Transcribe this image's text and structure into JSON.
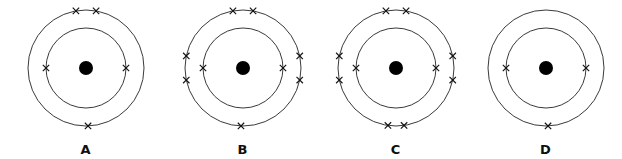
{
  "figure": {
    "background_color": "#ffffff",
    "ring_color": "#3a3a3a",
    "nucleus_color": "#000000",
    "electron_color": "#111111",
    "electron_glyph": "x",
    "width": 622,
    "height": 159
  },
  "chart_data": {
    "type": "diagram",
    "xlabel": "",
    "ylabel": "",
    "legend_position": "none",
    "grid": false,
    "categories": [
      "A",
      "B",
      "C",
      "D"
    ],
    "series": [
      {
        "name": "inner shell electrons",
        "values": [
          2,
          2,
          2,
          2
        ]
      },
      {
        "name": "outer shell electrons",
        "values": [
          3,
          7,
          8,
          1
        ]
      },
      {
        "name": "total electrons",
        "values": [
          5,
          9,
          10,
          3
        ]
      }
    ]
  },
  "atoms": [
    {
      "id": "atom-a",
      "label": "A",
      "left": 8,
      "center_x": 78,
      "center_y": 68,
      "inner_radius": 40,
      "outer_radius": 58,
      "nucleus_radius": 7,
      "inner_electron_angles": [
        180,
        0
      ],
      "outer_electron_angles": [
        272,
        100,
        80
      ],
      "inner_count": 2,
      "outer_count": 3,
      "total_count": 5
    },
    {
      "id": "atom-b",
      "label": "B",
      "left": 165,
      "center_x": 78,
      "center_y": 68,
      "inner_radius": 40,
      "outer_radius": 58,
      "nucleus_radius": 7,
      "inner_electron_angles": [
        180,
        0
      ],
      "outer_electron_angles": [
        268,
        168,
        192,
        12,
        348,
        100,
        80
      ],
      "inner_count": 2,
      "outer_count": 7,
      "total_count": 9
    },
    {
      "id": "atom-c",
      "label": "C",
      "left": 318,
      "center_x": 78,
      "center_y": 68,
      "inner_radius": 40,
      "outer_radius": 58,
      "nucleus_radius": 7,
      "inner_electron_angles": [
        180,
        0
      ],
      "outer_electron_angles": [
        262,
        278,
        168,
        192,
        12,
        348,
        100,
        80
      ],
      "inner_count": 2,
      "outer_count": 8,
      "total_count": 10
    },
    {
      "id": "atom-d",
      "label": "D",
      "left": 468,
      "center_x": 78,
      "center_y": 68,
      "inner_radius": 40,
      "outer_radius": 58,
      "nucleus_radius": 7,
      "inner_electron_angles": [
        180,
        0
      ],
      "outer_electron_angles": [
        272
      ],
      "inner_count": 2,
      "outer_count": 1,
      "total_count": 3
    }
  ]
}
